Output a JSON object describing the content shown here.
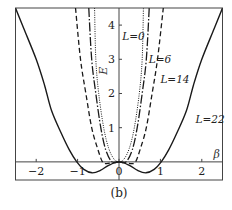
{
  "caption": "(b)",
  "chart_data": {
    "type": "line",
    "title": "",
    "xlabel": "β",
    "ylabel": "E",
    "xlim": [
      -2.5,
      2.5
    ],
    "ylim": [
      -0.53,
      4.5
    ],
    "grid": false,
    "legend": "inline labels",
    "x_ticks": [
      -2,
      -1,
      0,
      1,
      2
    ],
    "y_ticks": [
      1,
      2,
      3,
      4
    ],
    "series": [
      {
        "name": "L=22",
        "label": "L=22",
        "style": "solid",
        "label_pos": [
          1.85,
          1.15
        ],
        "points": [
          [
            -2.5,
            4.5
          ],
          [
            -2.3,
            3.9
          ],
          [
            -2.0,
            3.0
          ],
          [
            -1.8,
            2.25
          ],
          [
            -1.63,
            1.5
          ],
          [
            -1.4,
            0.85
          ],
          [
            -1.2,
            0.35
          ],
          [
            -1.02,
            0.0
          ],
          [
            -0.85,
            -0.22
          ],
          [
            -0.65,
            -0.32
          ],
          [
            -0.45,
            -0.25
          ],
          [
            -0.25,
            -0.1
          ],
          [
            0.0,
            0.0
          ],
          [
            0.25,
            -0.1
          ],
          [
            0.45,
            -0.25
          ],
          [
            0.65,
            -0.32
          ],
          [
            0.85,
            -0.22
          ],
          [
            1.02,
            0.0
          ],
          [
            1.2,
            0.35
          ],
          [
            1.4,
            0.85
          ],
          [
            1.63,
            1.5
          ],
          [
            1.8,
            2.25
          ],
          [
            2.0,
            3.0
          ],
          [
            2.3,
            3.9
          ],
          [
            2.5,
            4.5
          ]
        ]
      },
      {
        "name": "L=14",
        "label": "L=14",
        "style": "dashed",
        "label_pos": [
          1.0,
          2.3
        ],
        "points": [
          [
            -1.05,
            4.5
          ],
          [
            -0.93,
            3.0
          ],
          [
            -0.8,
            2.0
          ],
          [
            -0.66,
            1.0
          ],
          [
            -0.52,
            0.4
          ],
          [
            -0.4,
            0.0
          ],
          [
            -0.3,
            -0.05
          ],
          [
            -0.15,
            -0.02
          ],
          [
            0.0,
            0.0
          ],
          [
            0.15,
            -0.02
          ],
          [
            0.3,
            -0.05
          ],
          [
            0.4,
            0.0
          ],
          [
            0.52,
            0.4
          ],
          [
            0.66,
            1.0
          ],
          [
            0.8,
            2.0
          ],
          [
            0.93,
            3.0
          ],
          [
            1.07,
            4.5
          ]
        ]
      },
      {
        "name": "L=6",
        "label": "L=6",
        "style": "dashdot",
        "label_pos": [
          0.72,
          2.9
        ],
        "points": [
          [
            -0.73,
            4.5
          ],
          [
            -0.66,
            3.0
          ],
          [
            -0.56,
            2.0
          ],
          [
            -0.44,
            1.0
          ],
          [
            -0.32,
            0.35
          ],
          [
            -0.17,
            0.0
          ],
          [
            0.0,
            0.0
          ],
          [
            0.17,
            0.0
          ],
          [
            0.32,
            0.35
          ],
          [
            0.44,
            1.0
          ],
          [
            0.56,
            2.0
          ],
          [
            0.66,
            3.0
          ],
          [
            0.73,
            4.5
          ]
        ]
      },
      {
        "name": "L=0",
        "label": "L=0",
        "style": "dotted",
        "label_pos": [
          0.08,
          3.55
        ],
        "points": [
          [
            -0.59,
            4.5
          ],
          [
            -0.56,
            3.0
          ],
          [
            -0.49,
            2.0
          ],
          [
            -0.37,
            1.0
          ],
          [
            -0.25,
            0.4
          ],
          [
            -0.12,
            0.08
          ],
          [
            0.0,
            0.0
          ],
          [
            0.12,
            0.08
          ],
          [
            0.25,
            0.4
          ],
          [
            0.37,
            1.0
          ],
          [
            0.49,
            2.0
          ],
          [
            0.56,
            3.0
          ],
          [
            0.59,
            4.5
          ]
        ]
      }
    ]
  }
}
